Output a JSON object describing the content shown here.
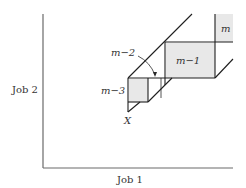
{
  "axes": {
    "x_label": "Job 1",
    "y_label": "Job 2"
  },
  "regions": {
    "m": "m",
    "m_minus_1": "m−1",
    "m_minus_2": "m−2",
    "m_minus_3": "m−3"
  },
  "point_label": "X",
  "colors": {
    "shade": "#e8e8e8",
    "line": "#1e1e1e",
    "axis": "#6a6a6a"
  }
}
